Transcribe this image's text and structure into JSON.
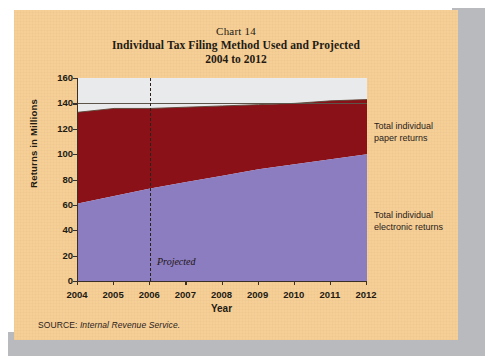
{
  "title": {
    "chart_number": "Chart 14",
    "line2": "Individual Tax Filing Method Used and Projected",
    "line3": "2004 to 2012"
  },
  "legend": {
    "paper_line1": "Total individual",
    "paper_line2": "paper returns",
    "electronic_line1": "Total individual",
    "electronic_line2": "electronic returns"
  },
  "annotation": {
    "projected": "Projected"
  },
  "source": {
    "prefix": "SOURCE:",
    "name": "Internal Revenue Service."
  },
  "colors": {
    "page_background": "#f6cf97",
    "plot_background": "#e9eaec",
    "paper_returns": "#8b1118",
    "electronic_returns": "#8c7cc0",
    "axis": "#3a3027",
    "text": "#231a12"
  },
  "chart_data": {
    "type": "area",
    "stacked": true,
    "title": "Individual Tax Filing Method Used and Projected 2004 to 2012",
    "xlabel": "Year",
    "ylabel": "Returns in Millions",
    "x": [
      2004,
      2005,
      2006,
      2007,
      2008,
      2009,
      2010,
      2011,
      2012
    ],
    "xlim": [
      2004,
      2012
    ],
    "ylim": [
      0,
      160
    ],
    "yticks": [
      0,
      20,
      40,
      60,
      80,
      100,
      120,
      140,
      160
    ],
    "xticks": [
      "2004",
      "2005",
      "2006",
      "2007",
      "2008",
      "2009",
      "2010",
      "2011",
      "2012"
    ],
    "grid": false,
    "gridlines_shown": [
      140
    ],
    "legend_position": "right-outside",
    "series": [
      {
        "name": "Total individual electronic returns",
        "color": "#8c7cc0",
        "values": [
          61,
          67,
          73,
          78,
          83,
          88,
          92,
          96,
          100
        ]
      },
      {
        "name": "Total individual paper returns",
        "color": "#8b1118",
        "values": [
          72,
          69,
          63,
          59,
          55,
          51,
          48,
          46,
          43
        ]
      }
    ],
    "cumulative_totals": [
      133,
      136,
      136,
      137,
      138,
      139,
      140,
      142,
      143
    ],
    "annotations": [
      {
        "text": "Projected",
        "x": 2006,
        "type": "vertical-dashed-line",
        "note": "Values at and after 2006 are projected"
      }
    ]
  }
}
